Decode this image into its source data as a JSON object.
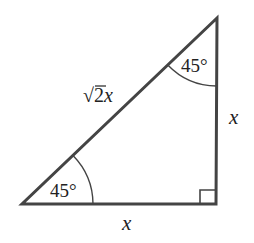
{
  "diagram": {
    "type": "right-isosceles-triangle",
    "stroke_color": "#444444",
    "text_color": "#222222",
    "vertices": {
      "top": [
        217,
        18
      ],
      "bottom_left": [
        22,
        204
      ],
      "bottom_right": [
        216,
        204
      ]
    },
    "labels": {
      "hypotenuse": {
        "text": "√2x",
        "radical": "√2",
        "variable": "x"
      },
      "right_side": "x",
      "bottom_side": "x",
      "top_angle": "45°",
      "bottom_left_angle": "45°"
    },
    "right_angle_marker": true
  }
}
